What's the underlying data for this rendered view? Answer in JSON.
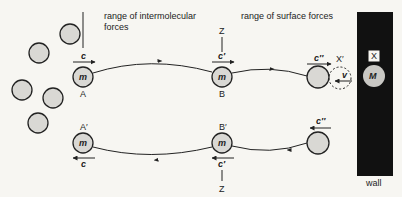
{
  "labels": {
    "intermolecular_line1": "range of intermolecular",
    "intermolecular_line2": "forces",
    "surface": "range of surface forces",
    "wall": "wall",
    "A": "A",
    "B": "B",
    "A_prime": "A′",
    "B_prime": "B′",
    "Z_top": "Z",
    "Z_bottom": "Z",
    "X": "X",
    "X_prime": "X′"
  },
  "molecules": {
    "m": "m",
    "M": "M"
  },
  "velocities": {
    "c": "c",
    "c_prime": "c′",
    "c_double_prime": "c′′",
    "v": "v"
  },
  "colors": {
    "background": "#f7f6f2",
    "wall": "#111111",
    "molecule_fill": "#d9d8d4",
    "stroke": "#222222"
  }
}
